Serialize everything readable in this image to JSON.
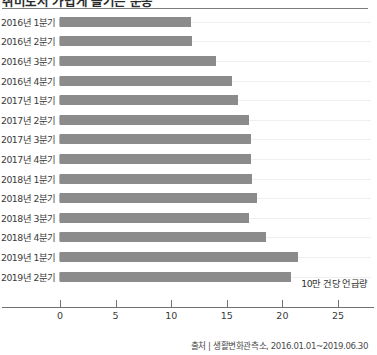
{
  "chart_data": {
    "type": "bar",
    "orientation": "horizontal",
    "title": "취미로서 가볍게 즐기는 운동",
    "categories": [
      "2016년 1분기",
      "2016년 2분기",
      "2016년 3분기",
      "2016년 4분기",
      "2017년 1분기",
      "2017년 2분기",
      "2017년 3분기",
      "2017년 4분기",
      "2018년 1분기",
      "2018년 2분기",
      "2018년 3분기",
      "2018년 4분기",
      "2019년 1분기",
      "2019년 2분기"
    ],
    "values": [
      11.8,
      11.9,
      14.0,
      15.5,
      16.0,
      17.0,
      17.2,
      17.2,
      17.3,
      17.7,
      17.0,
      18.5,
      21.4,
      20.8
    ],
    "xlabel": "10만 건당 언급량",
    "ylabel": "",
    "xlim": [
      0,
      27
    ],
    "xticks": [
      0,
      5,
      10,
      15,
      20,
      25
    ],
    "xtick_labels": [
      "0",
      "5",
      "10",
      "15",
      "20",
      "25"
    ],
    "grid": true,
    "legend": "none",
    "bar_color": "#8b8b8b",
    "source": "출처 | 생활변화관측소, 2016.01.01~2019.06.30"
  }
}
